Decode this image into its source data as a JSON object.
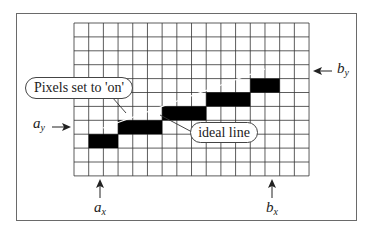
{
  "diagram": {
    "grid": {
      "columns": 16,
      "rows": 11,
      "origin_x": 74,
      "origin_y": 23,
      "cell_w": 14.69,
      "cell_h": 13.9
    },
    "pixels_on": [
      {
        "row": 8,
        "col_start": 1,
        "col_end": 2
      },
      {
        "row": 7,
        "col_start": 3,
        "col_end": 5
      },
      {
        "row": 6,
        "col_start": 6,
        "col_end": 8
      },
      {
        "row": 5,
        "col_start": 9,
        "col_end": 11
      },
      {
        "row": 4,
        "col_start": 12,
        "col_end": 13
      }
    ],
    "callouts": {
      "pixels_on": "Pixels set to 'on'",
      "ideal_line": "ideal line"
    },
    "labels": {
      "ay": {
        "base": "a",
        "sub": "y"
      },
      "by": {
        "base": "b",
        "sub": "y"
      },
      "ax": {
        "base": "a",
        "sub": "x"
      },
      "bx": {
        "base": "b",
        "sub": "x"
      }
    },
    "colors": {
      "grid": "#333333",
      "pixel_on": "#000000",
      "ideal_line": "#ffffff"
    }
  }
}
